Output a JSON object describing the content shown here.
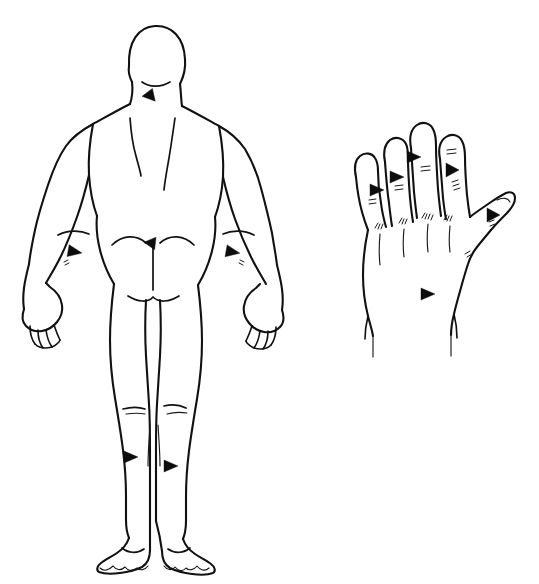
{
  "figure": {
    "title": "Posterior body and dorsal hand anatomical line drawing",
    "background_color": "#ffffff",
    "line_color": "#111111",
    "marker_color": "#0d0d0d",
    "width": 539,
    "height": 584
  },
  "panels": [
    {
      "id": "body-panel",
      "name": "posterior-body-figure",
      "view": "posterior",
      "description": "Full-body back view male figure, standing, arms slightly abducted, barefoot"
    },
    {
      "id": "hand-panel",
      "name": "dorsal-hand-figure",
      "view": "dorsal",
      "side": "left",
      "description": "Left hand dorsum, fingers extended and spread, thumb abducted"
    }
  ],
  "body_regions": [
    {
      "name": "head",
      "label": "Head"
    },
    {
      "name": "neck",
      "label": "Neck"
    },
    {
      "name": "shoulders",
      "label": "Shoulders"
    },
    {
      "name": "upper-back",
      "label": "Upper back"
    },
    {
      "name": "scapula-left",
      "label": "Left scapula"
    },
    {
      "name": "scapula-right",
      "label": "Right scapula"
    },
    {
      "name": "arms",
      "label": "Arms"
    },
    {
      "name": "elbow-left",
      "label": "Left elbow"
    },
    {
      "name": "elbow-right",
      "label": "Right elbow"
    },
    {
      "name": "lower-back",
      "label": "Lower back"
    },
    {
      "name": "buttocks",
      "label": "Buttocks"
    },
    {
      "name": "thighs",
      "label": "Thighs"
    },
    {
      "name": "popliteal-fossa-left",
      "label": "Left knee crease"
    },
    {
      "name": "popliteal-fossa-right",
      "label": "Right knee crease"
    },
    {
      "name": "calves",
      "label": "Calves"
    },
    {
      "name": "feet",
      "label": "Feet"
    }
  ],
  "hand_regions": [
    {
      "name": "index-finger",
      "label": "Index finger"
    },
    {
      "name": "middle-finger",
      "label": "Middle finger"
    },
    {
      "name": "ring-finger",
      "label": "Ring finger"
    },
    {
      "name": "little-finger",
      "label": "Little finger"
    },
    {
      "name": "thumb",
      "label": "Thumb"
    },
    {
      "name": "knuckles",
      "label": "Knuckles"
    },
    {
      "name": "dorsum",
      "label": "Dorsum of hand"
    },
    {
      "name": "wrist",
      "label": "Wrist"
    }
  ],
  "markers": {
    "count": 12,
    "glyph": "solid-triangle-arrowhead",
    "body": [
      {
        "id": "m1",
        "name": "marker-nape",
        "region": "neck",
        "x": 150,
        "y": 95,
        "rotation": 200
      },
      {
        "id": "m2",
        "name": "marker-forearm-left",
        "region": "forearm-left",
        "x": 76,
        "y": 252,
        "rotation": 10
      },
      {
        "id": "m3",
        "name": "marker-forearm-right",
        "region": "forearm-right",
        "x": 233,
        "y": 252,
        "rotation": 10
      },
      {
        "id": "m4",
        "name": "marker-sacrum",
        "region": "lower-back",
        "x": 152,
        "y": 243,
        "rotation": 215
      },
      {
        "id": "m5",
        "name": "marker-calf-left",
        "region": "calf-left",
        "x": 131,
        "y": 457,
        "rotation": 0
      },
      {
        "id": "m6",
        "name": "marker-calf-right",
        "region": "calf-right",
        "x": 171,
        "y": 466,
        "rotation": 0
      }
    ],
    "hand": [
      {
        "id": "m7",
        "name": "marker-little-finger",
        "region": "little-finger",
        "x": 377,
        "y": 190,
        "rotation": 0
      },
      {
        "id": "m8",
        "name": "marker-ring-finger",
        "region": "ring-finger",
        "x": 397,
        "y": 177,
        "rotation": 0
      },
      {
        "id": "m9",
        "name": "marker-middle-finger",
        "region": "middle-finger",
        "x": 414,
        "y": 157,
        "rotation": 0
      },
      {
        "id": "m10",
        "name": "marker-index-finger",
        "region": "index-finger",
        "x": 453,
        "y": 170,
        "rotation": 270
      },
      {
        "id": "m11",
        "name": "marker-thumb",
        "region": "thumb",
        "x": 494,
        "y": 215,
        "rotation": 270
      },
      {
        "id": "m12",
        "name": "marker-hand-dorsum",
        "region": "dorsum",
        "x": 428,
        "y": 294,
        "rotation": 0
      }
    ]
  },
  "hair_tufts": {
    "count": 14,
    "description": "Small sparse hair tick marks drawn beside markers on the forearms, fingers, knuckles and thumb",
    "locations": [
      "little-finger-middle-phalanx",
      "little-finger-proximal-phalanx",
      "ring-finger-middle-phalanx",
      "ring-finger-proximal-phalanx",
      "middle-finger-middle-phalanx",
      "middle-finger-proximal-phalanx",
      "index-finger-middle-phalanx",
      "index-finger-proximal-phalanx",
      "knuckle-little",
      "knuckle-ring",
      "knuckle-middle",
      "knuckle-index",
      "thumb-proximal",
      "thenar-web"
    ]
  }
}
